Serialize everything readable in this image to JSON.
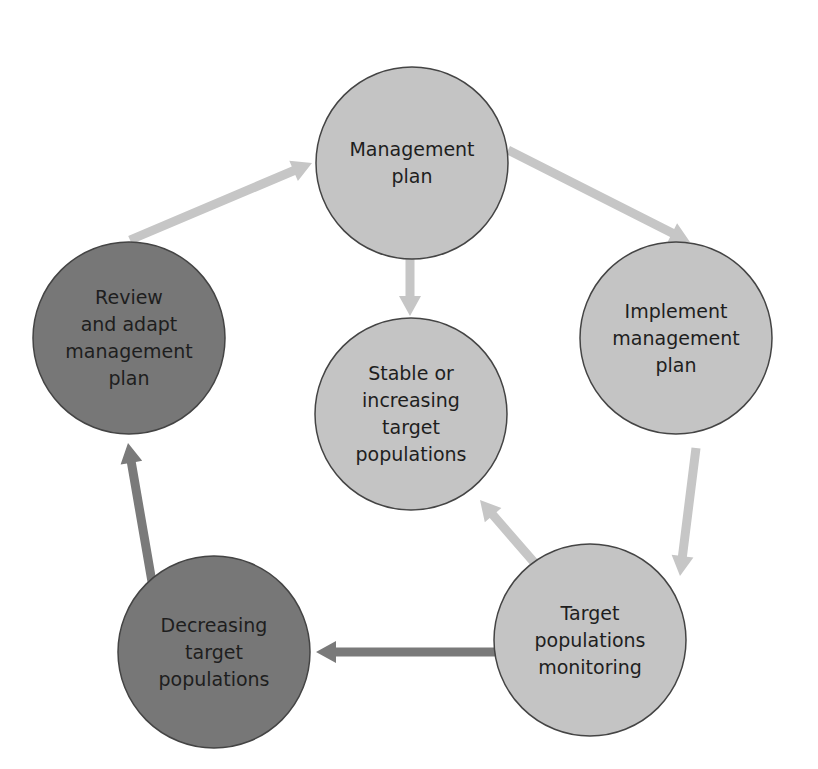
{
  "colors": {
    "light_fill": "#c4c4c4",
    "dark_fill": "#777777",
    "stroke": "#444444",
    "light_arrow": "#c6c6c6",
    "dark_arrow": "#7a7a7a",
    "text": "#1e1e1e",
    "background": "#ffffff"
  },
  "nodes": [
    {
      "id": "management-plan",
      "label": "Management\nplan",
      "cx": 412,
      "cy": 163,
      "r": 96,
      "tone": "light"
    },
    {
      "id": "implement-management-plan",
      "label": "Implement\nmanagement\nplan",
      "cx": 676,
      "cy": 338,
      "r": 96,
      "tone": "light"
    },
    {
      "id": "stable-or-increasing",
      "label": "Stable or\nincreasing\ntarget\npopulations",
      "cx": 411,
      "cy": 414,
      "r": 96,
      "tone": "light"
    },
    {
      "id": "review-and-adapt",
      "label": "Review\nand adapt\nmanagement\nplan",
      "cx": 129,
      "cy": 338,
      "r": 96,
      "tone": "dark"
    },
    {
      "id": "target-populations-monitoring",
      "label": "Target\npopulations\nmonitoring",
      "cx": 590,
      "cy": 640,
      "r": 96,
      "tone": "light"
    },
    {
      "id": "decreasing-target-populations",
      "label": "Decreasing\ntarget\npopulations",
      "cx": 214,
      "cy": 652,
      "r": 96,
      "tone": "dark"
    }
  ],
  "edges": [
    {
      "from": "management-plan",
      "to": "implement-management-plan",
      "x1": 508,
      "y1": 150,
      "x2": 690,
      "y2": 242,
      "tone": "light"
    },
    {
      "from": "implement-management-plan",
      "to": "target-populations-monitoring",
      "x1": 696,
      "y1": 448,
      "x2": 680,
      "y2": 576,
      "tone": "light"
    },
    {
      "from": "target-populations-monitoring",
      "to": "stable-or-increasing",
      "x1": 546,
      "y1": 576,
      "x2": 480,
      "y2": 500,
      "tone": "light"
    },
    {
      "from": "management-plan",
      "to": "stable-or-increasing",
      "x1": 410,
      "y1": 252,
      "x2": 410,
      "y2": 316,
      "tone": "light"
    },
    {
      "from": "target-populations-monitoring",
      "to": "decreasing-target-populations",
      "x1": 518,
      "y1": 652,
      "x2": 316,
      "y2": 652,
      "tone": "dark"
    },
    {
      "from": "decreasing-target-populations",
      "to": "review-and-adapt",
      "x1": 152,
      "y1": 582,
      "x2": 128,
      "y2": 443,
      "tone": "dark"
    },
    {
      "from": "review-and-adapt",
      "to": "management-plan",
      "x1": 130,
      "y1": 240,
      "x2": 312,
      "y2": 163,
      "tone": "light"
    }
  ]
}
